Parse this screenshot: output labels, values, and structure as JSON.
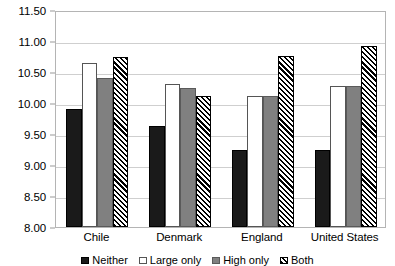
{
  "chart_data": {
    "type": "bar",
    "title": "",
    "subtitle": "",
    "xlabel": "",
    "ylabel": "",
    "categories": [
      "Chile",
      "Denmark",
      "England",
      "United States"
    ],
    "series": [
      {
        "name": "Neither",
        "swatch": "black",
        "color": "#1a1a1a",
        "values": [
          9.9,
          9.63,
          9.25,
          9.25
        ]
      },
      {
        "name": "Large only",
        "swatch": "white",
        "color": "#ffffff",
        "values": [
          10.65,
          10.31,
          10.11,
          10.28
        ]
      },
      {
        "name": "High only",
        "swatch": "gray",
        "color": "#808080",
        "values": [
          10.41,
          10.25,
          10.11,
          10.28
        ]
      },
      {
        "name": "Both",
        "swatch": "hatch",
        "color": "#000000",
        "values": [
          10.74,
          10.11,
          10.76,
          10.92
        ]
      }
    ],
    "ylim": [
      8.0,
      11.5
    ],
    "ytick_step": 0.5,
    "ytick_labels": [
      "11.50",
      "11.00",
      "10.50",
      "10.00",
      "9.50",
      "9.00",
      "8.50",
      "8.00"
    ],
    "ytick_values": [
      11.5,
      11.0,
      10.5,
      10.0,
      9.5,
      9.0,
      8.5,
      8.0
    ],
    "grid": true,
    "grid_axis": "y",
    "legend_position": "bottom",
    "plot_border_color": "#b4b4b4",
    "grid_color": "#cfcfcf",
    "background": "#ffffff"
  }
}
